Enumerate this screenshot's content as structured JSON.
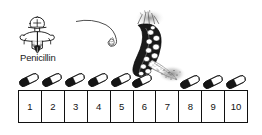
{
  "illustration": {
    "title": "Penicillin antibiotic course illustration",
    "style": "hand-drawn black and white line art",
    "background_color": "#ffffff",
    "ink_color": "#111111"
  },
  "labels": {
    "penicillin": "Penicillin"
  },
  "characters": [
    {
      "name": "penicillin-knight",
      "description": "small cartoon figure with round helmet head, wide shoulders and a spear, labelled Penicillin",
      "label": "Penicillin"
    },
    {
      "name": "germ-creature",
      "description": "large spotted curved bacterium with a long thin curling antenna and a speckled tail",
      "spot_count": 12
    }
  ],
  "capsules": {
    "count": 9,
    "description": "tilted two-tone capsule pills, dark lower half and white upper half",
    "over_boxes": [
      1,
      2,
      3,
      4,
      5,
      6,
      8,
      9,
      10
    ]
  },
  "boxes": {
    "count": 10,
    "numbers": [
      "1",
      "2",
      "3",
      "4",
      "5",
      "6",
      "7",
      "8",
      "9",
      "10"
    ]
  }
}
